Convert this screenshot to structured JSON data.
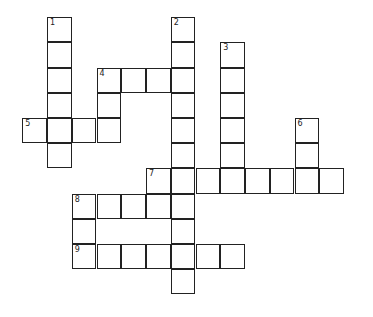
{
  "puzzle": {
    "type": "crossword",
    "origin_x": 23,
    "origin_y": 18,
    "cell_w": 24.75,
    "cell_h": 25.2,
    "words": [
      {
        "number": "1",
        "direction": "down",
        "col": 1,
        "row": 0,
        "length": 6
      },
      {
        "number": "2",
        "direction": "down",
        "col": 6,
        "row": 0,
        "length": 11
      },
      {
        "number": "3",
        "direction": "down",
        "col": 8,
        "row": 1,
        "length": 6
      },
      {
        "number": "4",
        "direction": "across",
        "col": 3,
        "row": 2,
        "length": 4
      },
      {
        "number": "",
        "direction": "down",
        "col": 3,
        "row": 2,
        "length": 3
      },
      {
        "number": "5",
        "direction": "across",
        "col": 0,
        "row": 4,
        "length": 4
      },
      {
        "number": "6",
        "direction": "down",
        "col": 11,
        "row": 4,
        "length": 3
      },
      {
        "number": "7",
        "direction": "across",
        "col": 5,
        "row": 6,
        "length": 8
      },
      {
        "number": "",
        "direction": "down",
        "col": 5,
        "row": 6,
        "length": 2
      },
      {
        "number": "8",
        "direction": "across",
        "col": 2,
        "row": 7,
        "length": 4
      },
      {
        "number": "",
        "direction": "down",
        "col": 2,
        "row": 7,
        "length": 3
      },
      {
        "number": "9",
        "direction": "across",
        "col": 2,
        "row": 9,
        "length": 7
      }
    ]
  }
}
